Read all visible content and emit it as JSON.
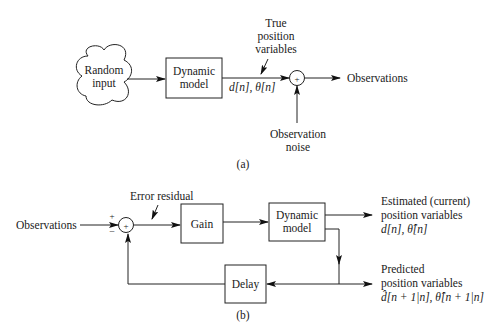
{
  "diagram_a": {
    "caption": "(a)",
    "source": {
      "line1": "Random",
      "line2": "input"
    },
    "model_box": {
      "line1": "Dynamic",
      "line2": "model"
    },
    "model_output": "d[n], θ[n]",
    "true_label": {
      "line1": "True",
      "line2": "position",
      "line3": "variables"
    },
    "summer_sign": "+",
    "output": "Observations",
    "noise": {
      "line1": "Observation",
      "line2": "noise"
    }
  },
  "diagram_b": {
    "caption": "(b)",
    "input": "Observations",
    "plus_sign": "+",
    "minus_sign": "−",
    "summer_sign": "+",
    "error_label": "Error residual",
    "gain_box": "Gain",
    "model_box": {
      "line1": "Dynamic",
      "line2": "model"
    },
    "delay_box": "Delay",
    "estimated": {
      "line1": "Estimated (current)",
      "line2": "position variables",
      "line3": "d[n], θ̂[n]"
    },
    "predicted": {
      "line1": "Predicted",
      "line2": "position variables",
      "line3": "d̂[n + 1|n], θ̂[n + 1|n]"
    }
  }
}
